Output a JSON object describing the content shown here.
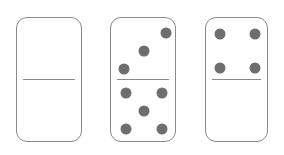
{
  "scene": {
    "title": "Dominoes",
    "width": 284,
    "height": 155,
    "background_color": "#ffffff"
  },
  "style": {
    "tile_fill": "#ffffff",
    "tile_border_color": "#8a8a8a",
    "tile_border_width": 1.4,
    "tile_corner_radius": 11,
    "divider_color": "#8a8a8a",
    "divider_width": 1.4,
    "pip_color": "#6e6e6e",
    "pip_diameter": 11
  },
  "dominoes": [
    {
      "name": "domino-blank-blank",
      "label": "0-0",
      "x": 16,
      "y": 17,
      "width": 66,
      "height": 125,
      "divider_y": 61,
      "divider_inset": 6,
      "top": {
        "value": 0,
        "label": "blank",
        "pips": []
      },
      "bottom": {
        "value": 0,
        "label": "blank",
        "pips": []
      }
    },
    {
      "name": "domino-three-five",
      "label": "3-5",
      "x": 110,
      "y": 17,
      "width": 66,
      "height": 125,
      "divider_y": 61,
      "divider_inset": 6,
      "top": {
        "value": 3,
        "label": "three",
        "pips": [
          {
            "cx": 55,
            "cy": 15
          },
          {
            "cx": 33,
            "cy": 33
          },
          {
            "cx": 13,
            "cy": 51
          }
        ]
      },
      "bottom": {
        "value": 5,
        "label": "five",
        "pips": [
          {
            "cx": 15,
            "cy": 14
          },
          {
            "cx": 51,
            "cy": 14
          },
          {
            "cx": 33,
            "cy": 32
          },
          {
            "cx": 15,
            "cy": 50
          },
          {
            "cx": 51,
            "cy": 50
          }
        ]
      }
    },
    {
      "name": "domino-four-blank",
      "label": "4-0",
      "x": 205,
      "y": 17,
      "width": 63,
      "height": 125,
      "divider_y": 61,
      "divider_inset": 6,
      "top": {
        "value": 4,
        "label": "four",
        "pips": [
          {
            "cx": 14,
            "cy": 16
          },
          {
            "cx": 49,
            "cy": 16
          },
          {
            "cx": 14,
            "cy": 50
          },
          {
            "cx": 49,
            "cy": 50
          }
        ]
      },
      "bottom": {
        "value": 0,
        "label": "blank",
        "pips": []
      }
    }
  ]
}
